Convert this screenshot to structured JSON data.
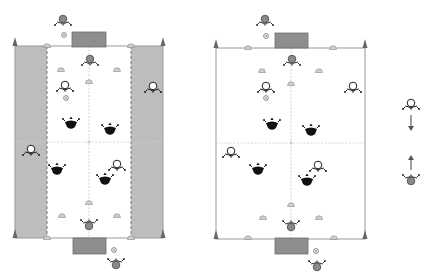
{
  "diagram": {
    "title": "",
    "colors": {
      "background": "#ffffff",
      "side_zone": "#bdbdbd",
      "field_line": "#9a9a9a",
      "goal": "#8e8e8e",
      "goal_stroke": "#6e6e6e",
      "flag": "#666666",
      "cone": "#c8c8c8",
      "team_black": "#111111",
      "team_white": "#ffffff",
      "goalkeeper": "#8a8a8a",
      "arrow": "#777777"
    },
    "fields": [
      {
        "id": "left",
        "has_side_zones": true,
        "x": 15,
        "y": 46,
        "w": 148,
        "h": 192,
        "inner_x1": 47,
        "inner_x2": 131,
        "center_x": 89,
        "mid_y": 142
      },
      {
        "id": "right",
        "has_side_zones": false,
        "x": 216,
        "y": 48,
        "w": 149,
        "h": 191,
        "inner_x1": 248,
        "inner_x2": 333,
        "center_x": 291,
        "mid_y": 143
      }
    ],
    "players": {
      "left": {
        "goalkeepers": [
          {
            "x": 63,
            "y": 20
          },
          {
            "x": 90,
            "y": 60
          },
          {
            "x": 89,
            "y": 225
          },
          {
            "x": 116,
            "y": 264
          }
        ],
        "white": [
          {
            "x": 65,
            "y": 86
          },
          {
            "x": 153,
            "y": 87
          },
          {
            "x": 31,
            "y": 150
          },
          {
            "x": 117,
            "y": 165
          }
        ],
        "black": [
          {
            "x": 71,
            "y": 124
          },
          {
            "x": 110,
            "y": 130
          },
          {
            "x": 57,
            "y": 170
          },
          {
            "x": 105,
            "y": 180
          }
        ],
        "balls": [
          {
            "x": 64,
            "y": 35
          },
          {
            "x": 66,
            "y": 98
          },
          {
            "x": 114,
            "y": 250
          }
        ]
      },
      "right": {
        "goalkeepers": [
          {
            "x": 265,
            "y": 20
          },
          {
            "x": 292,
            "y": 60
          },
          {
            "x": 291,
            "y": 226
          },
          {
            "x": 317,
            "y": 266
          }
        ],
        "white": [
          {
            "x": 266,
            "y": 87
          },
          {
            "x": 353,
            "y": 87
          },
          {
            "x": 231,
            "y": 152
          },
          {
            "x": 318,
            "y": 166
          }
        ],
        "black": [
          {
            "x": 272,
            "y": 125
          },
          {
            "x": 311,
            "y": 131
          },
          {
            "x": 258,
            "y": 170
          },
          {
            "x": 307,
            "y": 181
          }
        ],
        "balls": [
          {
            "x": 266,
            "y": 36
          },
          {
            "x": 266,
            "y": 98
          },
          {
            "x": 316,
            "y": 251
          }
        ]
      }
    },
    "cones": {
      "left": [
        {
          "x": 47,
          "y": 46
        },
        {
          "x": 131,
          "y": 46
        },
        {
          "x": 61,
          "y": 70
        },
        {
          "x": 117,
          "y": 70
        },
        {
          "x": 89,
          "y": 82
        },
        {
          "x": 89,
          "y": 203
        },
        {
          "x": 62,
          "y": 216
        },
        {
          "x": 117,
          "y": 216
        },
        {
          "x": 47,
          "y": 238
        },
        {
          "x": 131,
          "y": 238
        }
      ],
      "right": [
        {
          "x": 248,
          "y": 48
        },
        {
          "x": 333,
          "y": 48
        },
        {
          "x": 262,
          "y": 71
        },
        {
          "x": 319,
          "y": 71
        },
        {
          "x": 291,
          "y": 84
        },
        {
          "x": 291,
          "y": 205
        },
        {
          "x": 263,
          "y": 218
        },
        {
          "x": 319,
          "y": 218
        },
        {
          "x": 248,
          "y": 238
        },
        {
          "x": 334,
          "y": 238
        }
      ]
    },
    "goals": {
      "left": [
        {
          "x": 72,
          "y": 32,
          "w": 34,
          "h": 15
        },
        {
          "x": 73,
          "y": 238,
          "w": 33,
          "h": 16
        }
      ],
      "right": [
        {
          "x": 275,
          "y": 33,
          "w": 33,
          "h": 15
        },
        {
          "x": 275,
          "y": 238,
          "w": 33,
          "h": 16
        }
      ]
    },
    "legend": {
      "white_player": {
        "x": 411,
        "y": 104
      },
      "arrow_down": {
        "x": 411,
        "y1": 115,
        "y2": 131
      },
      "arrow_up": {
        "x": 411,
        "y1": 170,
        "y2": 155
      },
      "grey_player": {
        "x": 411,
        "y": 180
      }
    }
  }
}
